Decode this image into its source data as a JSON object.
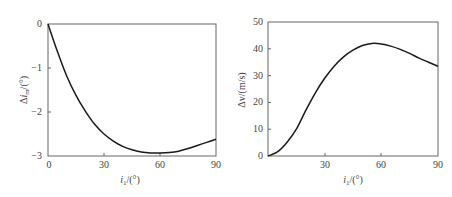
{
  "chart_data": [
    {
      "type": "line",
      "title": "",
      "xlabel": "i_1/(°)",
      "ylabel": "Δi_m/(°)",
      "xlim": [
        0,
        90
      ],
      "ylim": [
        -3,
        0
      ],
      "xticks": [
        0,
        30,
        60,
        90
      ],
      "yticks": [
        0,
        -1,
        -2,
        -3
      ],
      "grid": false,
      "series": [
        {
          "name": "Δi_m",
          "x": [
            0,
            5,
            10,
            15,
            20,
            25,
            30,
            35,
            40,
            45,
            50,
            55,
            60,
            65,
            70,
            75,
            80,
            85,
            90
          ],
          "values": [
            0,
            -0.62,
            -1.18,
            -1.62,
            -1.98,
            -2.28,
            -2.5,
            -2.66,
            -2.78,
            -2.86,
            -2.91,
            -2.93,
            -2.93,
            -2.92,
            -2.89,
            -2.83,
            -2.76,
            -2.69,
            -2.62
          ]
        }
      ]
    },
    {
      "type": "line",
      "title": "",
      "xlabel": "i_1/(°)",
      "ylabel": "Δv/(m/s)",
      "xlim": [
        0,
        90
      ],
      "ylim": [
        0,
        50
      ],
      "xticks": [
        30,
        60,
        90
      ],
      "yticks": [
        0,
        10,
        20,
        30,
        40,
        50
      ],
      "grid": false,
      "series": [
        {
          "name": "Δv",
          "x": [
            0,
            5,
            10,
            15,
            20,
            25,
            30,
            35,
            40,
            45,
            50,
            55,
            60,
            65,
            70,
            75,
            80,
            85,
            90
          ],
          "values": [
            0,
            1.5,
            5,
            10,
            17,
            23.5,
            29,
            33.5,
            37,
            39.5,
            41.2,
            42,
            41.8,
            41,
            39.8,
            38.3,
            36.5,
            35,
            33.5
          ]
        }
      ]
    }
  ],
  "left": {
    "y_tick_labels": [
      "0",
      "−1",
      "−2",
      "−3"
    ],
    "x_tick_labels": [
      "0",
      "30",
      "60",
      "90"
    ],
    "ylabel_delta": "Δ",
    "ylabel_var": "i",
    "ylabel_sub": "m",
    "ylabel_unit": "/(°)",
    "xlabel_var": "i",
    "xlabel_sub": "1",
    "xlabel_unit": "/(°)"
  },
  "right": {
    "y_tick_labels": [
      "0",
      "10",
      "20",
      "30",
      "40",
      "50"
    ],
    "x_tick_labels": [
      "30",
      "60",
      "90"
    ],
    "ylabel": "Δv/(m/s)",
    "xlabel_var": "i",
    "xlabel_sub": "1",
    "xlabel_unit": "/(°)"
  },
  "colors": {
    "curve": "#1a1a1a",
    "frame": "#666666",
    "text": "#444444"
  }
}
